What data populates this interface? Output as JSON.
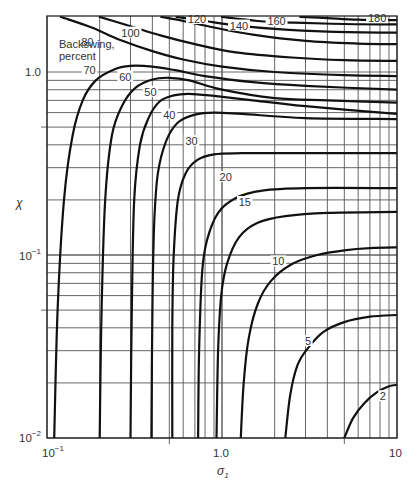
{
  "chart_data": {
    "type": "line",
    "title": "",
    "xlabel": "σ₁",
    "ylabel": "χ",
    "x_scale": "log",
    "y_scale": "log",
    "xlim": [
      0.1,
      10
    ],
    "ylim": [
      0.01,
      2.0
    ],
    "grid": true,
    "x_tick_labels": [
      {
        "value": 0.1,
        "label": "10",
        "sup": "−1"
      },
      {
        "value": 1.0,
        "label": "1.0",
        "sup": ""
      },
      {
        "value": 10,
        "label": "10",
        "sup": ""
      }
    ],
    "y_tick_labels": [
      {
        "value": 1.0,
        "label": "1.0",
        "sup": ""
      },
      {
        "value": 0.1,
        "label": "10",
        "sup": "−1"
      },
      {
        "value": 0.01,
        "label": "10",
        "sup": "−2"
      }
    ],
    "legend_title": [
      "Backswing,",
      "percent"
    ],
    "series": [
      {
        "name": "2",
        "label_at": [
          8.3,
          0.0165
        ],
        "points": [
          [
            5.0,
            0.01
          ],
          [
            5.6,
            0.0128
          ],
          [
            6.5,
            0.0155
          ],
          [
            7.7,
            0.0178
          ],
          [
            9.0,
            0.0192
          ],
          [
            10,
            0.0195
          ]
        ]
      },
      {
        "name": "5",
        "label_at": [
          3.1,
          0.033
        ],
        "points": [
          [
            2.3,
            0.01
          ],
          [
            2.45,
            0.017
          ],
          [
            2.7,
            0.025
          ],
          [
            3.1,
            0.031
          ],
          [
            3.8,
            0.038
          ],
          [
            5,
            0.043
          ],
          [
            7,
            0.046
          ],
          [
            10,
            0.047
          ]
        ]
      },
      {
        "name": "10",
        "label_at": [
          2.1,
          0.09
        ],
        "points": [
          [
            1.28,
            0.01
          ],
          [
            1.33,
            0.02
          ],
          [
            1.42,
            0.035
          ],
          [
            1.6,
            0.054
          ],
          [
            1.9,
            0.072
          ],
          [
            2.5,
            0.089
          ],
          [
            3.5,
            0.1
          ],
          [
            5,
            0.106
          ],
          [
            7,
            0.109
          ],
          [
            10,
            0.11
          ]
        ]
      },
      {
        "name": "15",
        "label_at": [
          1.35,
          0.19
        ],
        "points": [
          [
            0.93,
            0.01
          ],
          [
            0.95,
            0.03
          ],
          [
            0.99,
            0.06
          ],
          [
            1.07,
            0.09
          ],
          [
            1.25,
            0.125
          ],
          [
            1.6,
            0.15
          ],
          [
            2.3,
            0.163
          ],
          [
            4,
            0.17
          ],
          [
            10,
            0.172
          ]
        ]
      },
      {
        "name": "20",
        "label_at": [
          1.05,
          0.26
        ],
        "points": [
          [
            0.73,
            0.01
          ],
          [
            0.74,
            0.03
          ],
          [
            0.77,
            0.08
          ],
          [
            0.82,
            0.12
          ],
          [
            0.95,
            0.17
          ],
          [
            1.2,
            0.205
          ],
          [
            1.7,
            0.225
          ],
          [
            3,
            0.232
          ],
          [
            10,
            0.232
          ]
        ]
      },
      {
        "name": "30",
        "label_at": [
          0.67,
          0.41
        ],
        "points": [
          [
            0.52,
            0.01
          ],
          [
            0.52,
            0.04
          ],
          [
            0.53,
            0.1
          ],
          [
            0.56,
            0.2
          ],
          [
            0.62,
            0.28
          ],
          [
            0.72,
            0.33
          ],
          [
            0.9,
            0.355
          ],
          [
            1.3,
            0.36
          ],
          [
            3,
            0.36
          ],
          [
            10,
            0.36
          ]
        ]
      },
      {
        "name": "40",
        "label_at": [
          0.5,
          0.57
        ],
        "points": [
          [
            0.395,
            0.01
          ],
          [
            0.4,
            0.05
          ],
          [
            0.41,
            0.15
          ],
          [
            0.43,
            0.28
          ],
          [
            0.48,
            0.42
          ],
          [
            0.56,
            0.53
          ],
          [
            0.7,
            0.585
          ],
          [
            0.9,
            0.6
          ],
          [
            1.3,
            0.59
          ],
          [
            3,
            0.56
          ],
          [
            10,
            0.553
          ]
        ]
      },
      {
        "name": "50",
        "label_at": [
          0.39,
          0.76
        ],
        "points": [
          [
            0.3,
            0.01
          ],
          [
            0.305,
            0.05
          ],
          [
            0.315,
            0.2
          ],
          [
            0.34,
            0.4
          ],
          [
            0.38,
            0.56
          ],
          [
            0.44,
            0.69
          ],
          [
            0.53,
            0.745
          ],
          [
            0.65,
            0.76
          ],
          [
            0.9,
            0.74
          ],
          [
            1.5,
            0.7
          ],
          [
            3,
            0.65
          ],
          [
            10,
            0.59
          ]
        ]
      },
      {
        "name": "60",
        "label_at": [
          0.28,
          0.92
        ],
        "points": [
          [
            0.2,
            0.01
          ],
          [
            0.205,
            0.05
          ],
          [
            0.215,
            0.2
          ],
          [
            0.235,
            0.45
          ],
          [
            0.27,
            0.66
          ],
          [
            0.32,
            0.82
          ],
          [
            0.4,
            0.91
          ],
          [
            0.5,
            0.93
          ],
          [
            0.65,
            0.9
          ],
          [
            1.0,
            0.8
          ],
          [
            2,
            0.72
          ],
          [
            4,
            0.7
          ],
          [
            10,
            0.68
          ]
        ]
      },
      {
        "name": "70",
        "label_at": [
          0.175,
          1.0
        ],
        "points": [
          [
            0.11,
            0.01
          ],
          [
            0.115,
            0.05
          ],
          [
            0.125,
            0.2
          ],
          [
            0.14,
            0.45
          ],
          [
            0.16,
            0.7
          ],
          [
            0.19,
            0.9
          ],
          [
            0.24,
            1.03
          ],
          [
            0.3,
            1.08
          ],
          [
            0.4,
            1.07
          ],
          [
            0.55,
            1.02
          ],
          [
            0.8,
            0.95
          ],
          [
            1.5,
            0.88
          ],
          [
            3,
            0.84
          ],
          [
            10,
            0.8
          ]
        ]
      },
      {
        "name": "80",
        "label_at": [
          0.17,
          1.42
        ],
        "points": [
          [
            0.12,
            2.0
          ],
          [
            0.18,
            1.75
          ],
          [
            0.26,
            1.5
          ],
          [
            0.4,
            1.3
          ],
          [
            0.6,
            1.17
          ],
          [
            1.0,
            1.07
          ],
          [
            2,
            1.0
          ],
          [
            5,
            0.96
          ],
          [
            10,
            0.95
          ]
        ]
      },
      {
        "name": "100",
        "label_at": [
          0.3,
          1.6
        ],
        "points": [
          [
            0.2,
            2.0
          ],
          [
            0.3,
            1.78
          ],
          [
            0.45,
            1.58
          ],
          [
            0.7,
            1.42
          ],
          [
            1.2,
            1.28
          ],
          [
            2.5,
            1.2
          ],
          [
            5,
            1.16
          ],
          [
            10,
            1.15
          ]
        ]
      },
      {
        "name": "120",
        "label_at": [
          0.72,
          1.9
        ],
        "points": [
          [
            0.45,
            2.0
          ],
          [
            0.6,
            1.9
          ],
          [
            0.9,
            1.75
          ],
          [
            1.5,
            1.6
          ],
          [
            3,
            1.48
          ],
          [
            6,
            1.43
          ],
          [
            10,
            1.42
          ]
        ]
      },
      {
        "name": "140",
        "label_at": [
          1.25,
          1.75
        ],
        "points": [
          [
            0.55,
            2.0
          ],
          [
            0.8,
            1.9
          ],
          [
            1.2,
            1.8
          ],
          [
            2,
            1.72
          ],
          [
            4,
            1.66
          ],
          [
            10,
            1.64
          ]
        ]
      },
      {
        "name": "160",
        "label_at": [
          2.05,
          1.85
        ],
        "points": [
          [
            1.0,
            2.0
          ],
          [
            1.6,
            1.9
          ],
          [
            2.6,
            1.86
          ],
          [
            5,
            1.83
          ],
          [
            10,
            1.82
          ]
        ]
      },
      {
        "name": "180",
        "label_at": [
          7.7,
          1.92
        ],
        "points": [
          [
            2.8,
            2.0
          ],
          [
            4,
            1.97
          ],
          [
            6,
            1.93
          ],
          [
            10,
            1.92
          ]
        ]
      }
    ]
  },
  "labels": {
    "legend_line1": "Backswing,",
    "legend_line2": "percent",
    "y_axis_title": "χ",
    "x_axis_title": "σ",
    "x_axis_subscript": "1",
    "x_tick_0": "10",
    "x_tick_0_sup": "−1",
    "x_tick_1": "1.0",
    "x_tick_2": "10",
    "y_tick_0": "1.0",
    "y_tick_1": "10",
    "y_tick_1_sup": "−1",
    "y_tick_2": "10",
    "y_tick_2_sup": "−2"
  }
}
